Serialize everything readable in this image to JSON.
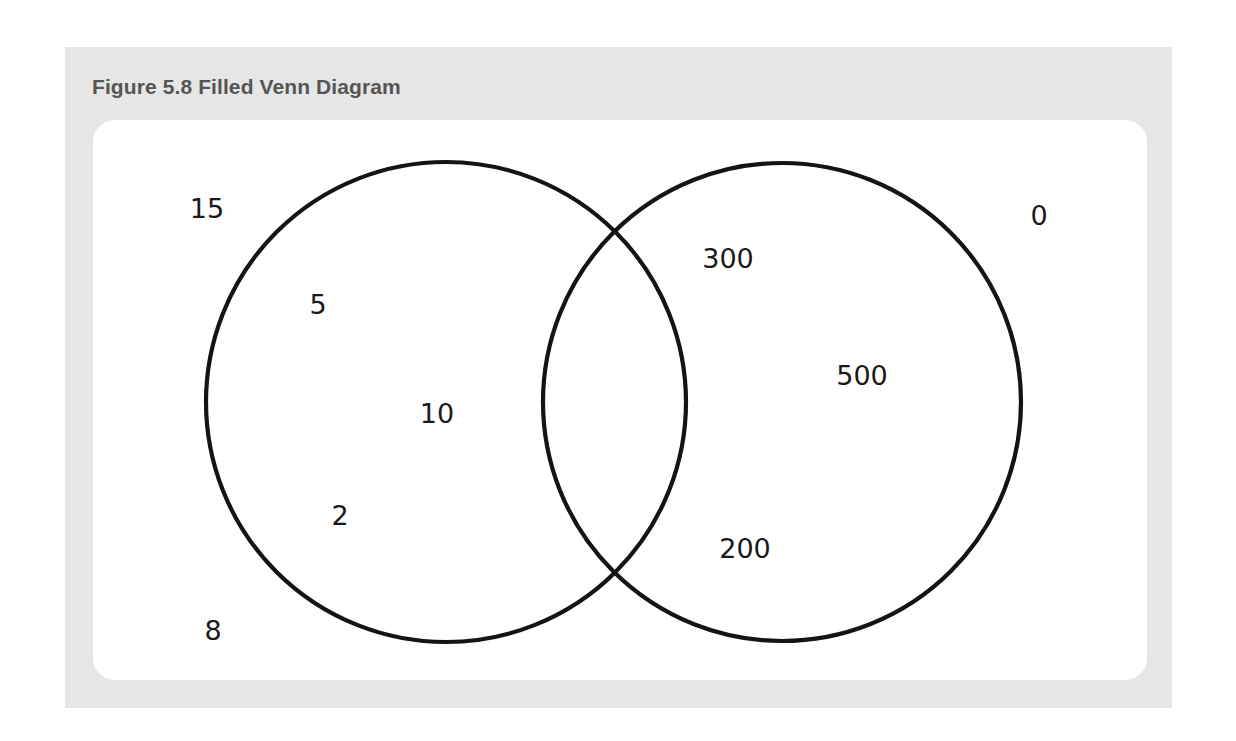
{
  "figure": {
    "title": "Figure 5.8 Filled Venn Diagram"
  },
  "venn": {
    "circles": [
      {
        "name": "left-set",
        "cx": 446,
        "cy": 402,
        "r": 240
      },
      {
        "name": "right-set",
        "cx": 782,
        "cy": 402,
        "r": 239
      }
    ],
    "labels": {
      "outside_top_left": "15",
      "left_only_upper": "5",
      "left_only_center": "10",
      "left_only_lower": "2",
      "outside_bottom_left": "8",
      "right_only_upper": "300",
      "right_only_center": "500",
      "right_only_lower": "200",
      "outside_top_right": "0"
    },
    "colors": {
      "stroke": "#141414",
      "panel_background": "#e6e6e6",
      "card_background": "#ffffff",
      "title_color": "#555555"
    }
  }
}
